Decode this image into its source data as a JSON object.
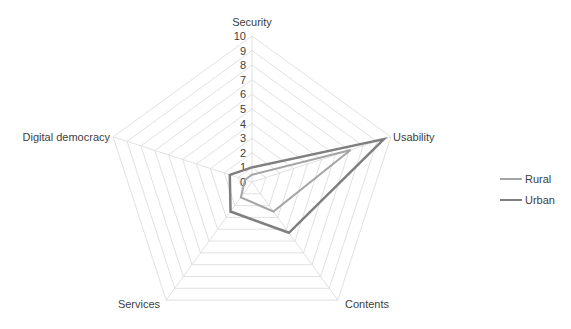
{
  "chart_data": {
    "type": "radar",
    "title": "",
    "categories": [
      "Security",
      "Usability",
      "Contents",
      "Services",
      "Digital democracy"
    ],
    "series": [
      {
        "name": "Rural",
        "values": [
          0.5,
          7.1,
          2.5,
          1.3,
          0.5
        ],
        "color": "#a5a5a5"
      },
      {
        "name": "Urban",
        "values": [
          1.0,
          9.5,
          4.3,
          2.5,
          1.6
        ],
        "color": "#7f7f7f"
      }
    ],
    "rlim": [
      0,
      10
    ],
    "ticks": [
      "0",
      "1",
      "2",
      "3",
      "4",
      "5",
      "6",
      "7",
      "8",
      "9",
      "10"
    ],
    "grid": true,
    "legend_position": "right"
  },
  "legend": {
    "items": [
      {
        "label": "Rural",
        "color": "#a5a5a5"
      },
      {
        "label": "Urban",
        "color": "#7f7f7f"
      }
    ]
  }
}
